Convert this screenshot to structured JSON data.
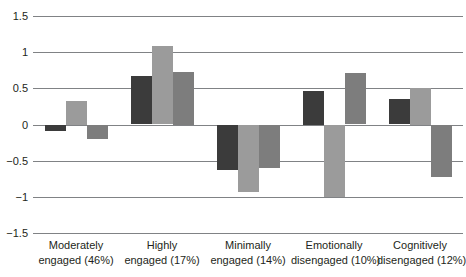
{
  "chart_data": {
    "type": "bar",
    "title": "",
    "subtitle": "",
    "xlabel": "",
    "ylabel": "",
    "ylim": [
      -1.5,
      1.5
    ],
    "yticks": [
      "1.5",
      "1",
      "0.5",
      "0",
      "-0.5",
      "-1",
      "-1.5"
    ],
    "ytick_values": [
      1.5,
      1,
      0.5,
      0,
      -0.5,
      -1,
      -1.5
    ],
    "grid": true,
    "legend": "none",
    "orientation": "vertical",
    "grouped": true,
    "categories": [
      "Moderately engaged (46%)",
      "Highly engaged (17%)",
      "Minimally engaged (14%)",
      "Emotionally disengaged (10%)",
      "Cognitively disengaged (12%)"
    ],
    "category_lines": [
      {
        "line1": "Moderately",
        "line2": "engaged (46%)"
      },
      {
        "line1": "Highly",
        "line2": "engaged (17%)"
      },
      {
        "line1": "Minimally",
        "line2": "engaged (14%)"
      },
      {
        "line1": "Emotionally",
        "line2": "disengaged (10%)"
      },
      {
        "line1": "Cognitively",
        "line2": "disengaged (12%)"
      }
    ],
    "series": [
      {
        "name": "series-1",
        "color": "#3b3b3b",
        "values": [
          -0.08,
          0.67,
          -0.62,
          0.47,
          0.35
        ]
      },
      {
        "name": "series-2",
        "color": "#9b9b9b",
        "values": [
          0.33,
          1.08,
          -0.92,
          -1.0,
          0.51
        ]
      },
      {
        "name": "series-3",
        "color": "#7d7d7d",
        "values": [
          -0.19,
          0.73,
          -0.6,
          0.71,
          -0.72
        ]
      }
    ],
    "colors": {
      "series_1": "#3b3b3b",
      "series_2": "#9b9b9b",
      "series_3": "#7d7d7d",
      "gridline": "#808285",
      "text": "#231f20",
      "background": "#ffffff"
    }
  }
}
